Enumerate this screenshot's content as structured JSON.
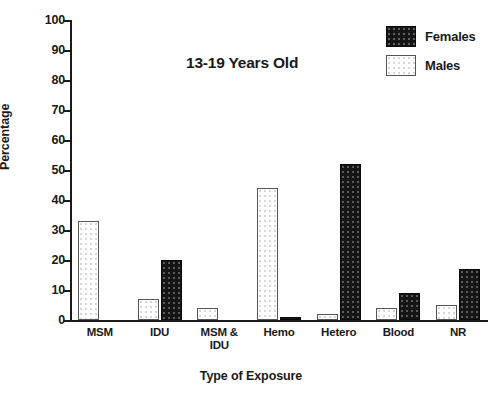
{
  "chart_data": {
    "type": "bar",
    "title": "13-19 Years Old",
    "xlabel": "Type of Exposure",
    "ylabel": "Percentage",
    "ylim": [
      0,
      100
    ],
    "yticks": [
      0,
      10,
      20,
      30,
      40,
      50,
      60,
      70,
      80,
      90,
      100
    ],
    "grid": false,
    "legend_position": "top-right",
    "categories": [
      "MSM",
      "IDU",
      "MSM &\nIDU",
      "Hemo",
      "Hetero",
      "Blood",
      "NR"
    ],
    "series": [
      {
        "name": "Males",
        "color": "#ffffff",
        "values": [
          33,
          7,
          4,
          44,
          2,
          4,
          5
        ]
      },
      {
        "name": "Females",
        "color": "#151515",
        "values": [
          0,
          20,
          0,
          1,
          52,
          9,
          17
        ]
      }
    ]
  }
}
